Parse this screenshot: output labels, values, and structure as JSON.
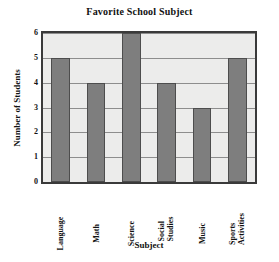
{
  "chart_data": {
    "type": "bar",
    "title": "Favorite School Subject",
    "xlabel": "Subject",
    "ylabel": "Number of Students",
    "categories": [
      "Language",
      "Math",
      "Science",
      "Social Studies",
      "Music",
      "Sports Activities"
    ],
    "category_lines": [
      [
        "Language"
      ],
      [
        "Math"
      ],
      [
        "Science"
      ],
      [
        "Social",
        "Studies"
      ],
      [
        "Music"
      ],
      [
        "Sports",
        "Activities"
      ]
    ],
    "values": [
      5,
      4,
      6,
      4,
      3,
      5
    ],
    "ylim": [
      0,
      6
    ],
    "yticks": [
      0,
      1,
      2,
      3,
      4,
      5,
      6
    ],
    "ytick_labels": [
      "0",
      "1",
      "2",
      "3",
      "4",
      "5",
      "6"
    ],
    "grid": true,
    "legend": null,
    "colors": {
      "bar_fill": "#7e7e7e",
      "bar_edge": "#4d4d4d",
      "plot_background": "#ececeb",
      "plot_border": "#3a3a3a",
      "gridline": "#8d8d8d",
      "text": "#111111",
      "page_background": "#ffffff"
    }
  }
}
